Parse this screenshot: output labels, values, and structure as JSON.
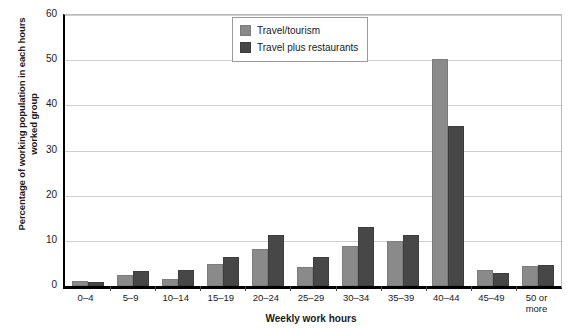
{
  "chart_data": {
    "type": "bar",
    "title": "",
    "xlabel": "Weekly work hours",
    "ylabel": "Percentage of working population in each hours worked group",
    "ylim": [
      0,
      60
    ],
    "yticks": [
      0,
      10,
      20,
      30,
      40,
      50,
      60
    ],
    "grid": "horizontal",
    "legend_position": "top-center",
    "categories": [
      "0–4",
      "5–9",
      "10–14",
      "15–19",
      "20–24",
      "25–29",
      "30–34",
      "35–39",
      "40–44",
      "45–49",
      "50 or more"
    ],
    "series": [
      {
        "name": "Travel/tourism",
        "color": "#8a8a8a",
        "values": [
          1.2,
          2.5,
          1.5,
          4.8,
          8.3,
          4.1,
          8.8,
          10.0,
          50.3,
          3.5,
          4.5
        ]
      },
      {
        "name": "Travel plus restaurants",
        "color": "#474747",
        "values": [
          0.8,
          3.3,
          3.5,
          6.5,
          11.3,
          6.5,
          13.0,
          11.2,
          35.5,
          2.9,
          4.7
        ]
      }
    ]
  },
  "colors": {
    "light_bar": "#8a8a8a",
    "dark_bar": "#474747",
    "gridline": "#cfcfcf",
    "axis": "#000000",
    "background": "#ffffff"
  }
}
